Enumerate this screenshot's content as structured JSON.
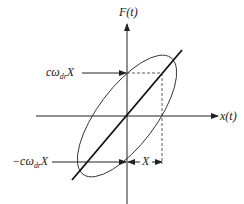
{
  "diagram": {
    "axes": {
      "y_label": "F(t)",
      "x_label": "x(t)"
    },
    "annotations": {
      "upper_intercept_prefix": "cω",
      "upper_intercept_sub": "dr",
      "upper_intercept_suffix": "X",
      "lower_intercept_prefix": "−cω",
      "lower_intercept_sub": "dr",
      "lower_intercept_suffix": "X",
      "amplitude": "X"
    },
    "colors": {
      "line": "#222222",
      "background": "#ffffff"
    }
  }
}
